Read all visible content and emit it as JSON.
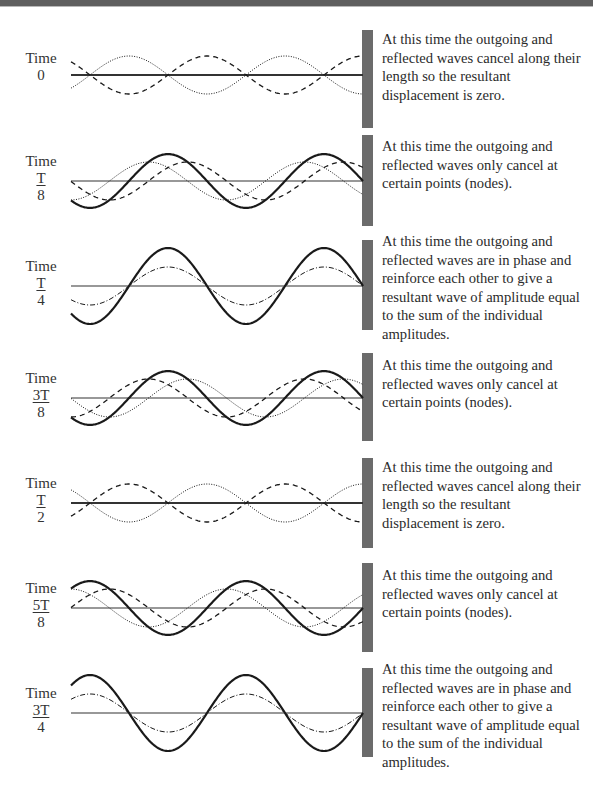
{
  "figure": {
    "colors": {
      "wall": "#6b6b6b",
      "line": "#1a1a1a",
      "axis": "#333333",
      "top_band": "#5f5f5f"
    },
    "geometry": {
      "x_start": 71,
      "wall_x": 363,
      "wall_width": 11,
      "wavelength": 156,
      "amplitude": 19
    },
    "panels": [
      {
        "id": "t0",
        "time_label": "Time",
        "num": "0",
        "den": "",
        "phase_fraction": 0,
        "axis_y": 75,
        "wall_top": 30,
        "wall_bottom": 128,
        "text_top": 30,
        "description": "At this time the outgoing and reflected waves cancel along their length so the resultant displacement is zero."
      },
      {
        "id": "t1_8",
        "time_label": "Time",
        "num": "T",
        "den": "8",
        "phase_fraction": 0.125,
        "axis_y": 181,
        "wall_top": 135,
        "wall_bottom": 226,
        "text_top": 137,
        "description": "At this time the outgoing and reflected waves only cancel at certain points (nodes)."
      },
      {
        "id": "t1_4",
        "time_label": "Time",
        "num": "T",
        "den": "4",
        "phase_fraction": 0.25,
        "axis_y": 286,
        "wall_top": 240,
        "wall_bottom": 330,
        "text_top": 232,
        "description": "At this time the outgoing and reflected waves are in phase and reinforce each other to give a resultant wave of amplitude equal to the sum of the individual amplitudes."
      },
      {
        "id": "t3_8",
        "time_label": "Time",
        "num": "3T",
        "den": "8",
        "phase_fraction": 0.375,
        "axis_y": 398,
        "wall_top": 353,
        "wall_bottom": 441,
        "text_top": 356,
        "description": "At this time the outgoing and reflected waves only cancel at certain points (nodes)."
      },
      {
        "id": "t1_2",
        "time_label": "Time",
        "num": "T",
        "den": "2",
        "phase_fraction": 0.5,
        "axis_y": 503,
        "wall_top": 458,
        "wall_bottom": 548,
        "text_top": 458,
        "description": "At this time the outgoing and reflected waves cancel along their length so the resultant displacement is zero."
      },
      {
        "id": "t5_8",
        "time_label": "Time",
        "num": "5T",
        "den": "8",
        "phase_fraction": 0.625,
        "axis_y": 608,
        "wall_top": 563,
        "wall_bottom": 652,
        "text_top": 566,
        "description": "At this time the outgoing and reflected waves only cancel at certain points (nodes)."
      },
      {
        "id": "t3_4",
        "time_label": "Time",
        "num": "3T",
        "den": "4",
        "phase_fraction": 0.75,
        "axis_y": 713,
        "wall_top": 668,
        "wall_bottom": 757,
        "text_top": 660,
        "description": "At this time the outgoing and reflected waves are in phase and reinforce each other to give a resultant wave of amplitude equal to the sum of the individual amplitudes."
      }
    ],
    "legend_implicit": {
      "dashed": "outgoing wave",
      "dotted": "reflected wave",
      "bold": "resultant wave",
      "dash_dot": "outgoing and reflected waves coinciding"
    }
  }
}
